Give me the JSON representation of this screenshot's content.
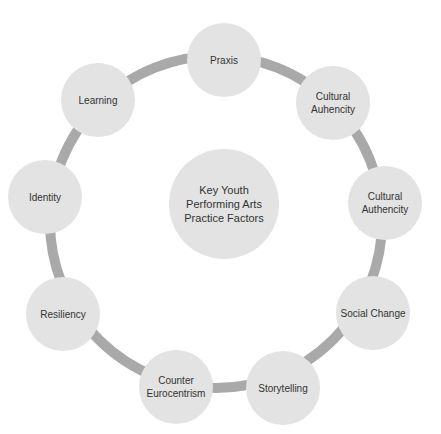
{
  "diagram": {
    "center": {
      "label": "Key Youth Performing Arts Practice Factors"
    },
    "nodes": [
      {
        "label": "Praxis"
      },
      {
        "label": "Cultural Auhencity"
      },
      {
        "label": "Cultural Authencity"
      },
      {
        "label": "Social Change"
      },
      {
        "label": "Storytelling"
      },
      {
        "label": "Counter Eurocentrism"
      },
      {
        "label": "Resiliency"
      },
      {
        "label": "Identity"
      },
      {
        "label": "Learning"
      }
    ],
    "colors": {
      "node_fill": "#e3e3e3",
      "ring": "#a9a9a9",
      "text": "#333333"
    }
  }
}
